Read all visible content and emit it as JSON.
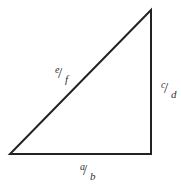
{
  "diagram": {
    "type": "right-triangle",
    "stroke_color": "#222222",
    "vertices": {
      "bottom_left": [
        10,
        154
      ],
      "bottom_right": [
        151,
        154
      ],
      "top_right": [
        151,
        10
      ]
    },
    "sides": {
      "hypotenuse": {
        "numerator": "e",
        "denominator": "f"
      },
      "vertical": {
        "numerator": "c",
        "denominator": "d"
      },
      "base": {
        "numerator": "a",
        "denominator": "b"
      }
    }
  }
}
